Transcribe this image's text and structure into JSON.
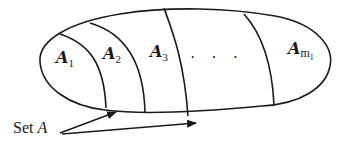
{
  "diagram": {
    "type": "set-partition",
    "container": "ellipse",
    "partitions": [
      {
        "label": "A",
        "subscript": "1"
      },
      {
        "label": "A",
        "subscript": "2"
      },
      {
        "label": "A",
        "subscript": "3"
      },
      {
        "label": "· · ·",
        "subscript": ""
      },
      {
        "label": "A",
        "subscript": "m",
        "sub_subscript": "1"
      }
    ],
    "annotation": {
      "text_plain": "Set ",
      "text_italic": "A",
      "arrow_count": 2
    },
    "colors": {
      "stroke": "#1a1a1a",
      "background": "#ffffff"
    }
  }
}
